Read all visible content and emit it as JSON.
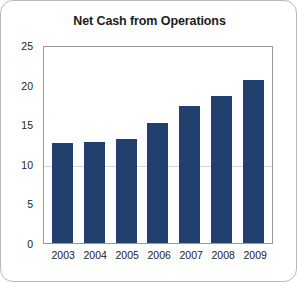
{
  "card": {
    "background_color": "#ffffff",
    "border_color": "#b9b9b9"
  },
  "chart_data": {
    "type": "bar",
    "title": "Net Cash from Operations",
    "xlabel": "",
    "ylabel": "",
    "categories": [
      "2003",
      "2004",
      "2005",
      "2006",
      "2007",
      "2008",
      "2009"
    ],
    "values": [
      12.6,
      12.8,
      13.1,
      15.2,
      17.3,
      18.6,
      20.6
    ],
    "ylim": [
      0,
      25
    ],
    "yticks": [
      "0",
      "5",
      "10",
      "15",
      "20",
      "25"
    ],
    "ytick_values": [
      0,
      5,
      10,
      15,
      20,
      25
    ],
    "gridlines": [
      10
    ],
    "grid": true,
    "legend": null,
    "bar_color": "#22406e",
    "plot_border_color": "#9a9a9a",
    "gridline_color": "#d7d7d7",
    "text_color": "#1c1c1c"
  }
}
